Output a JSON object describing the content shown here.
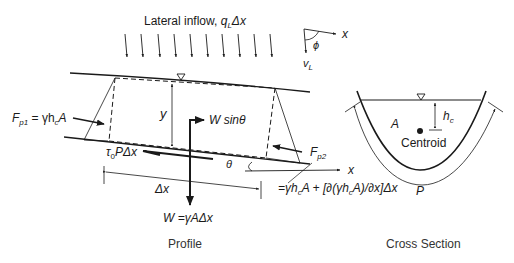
{
  "diagram": {
    "title_lateral_inflow": "Lateral inflow, ",
    "lateral_inflow_symbol": "q",
    "lateral_inflow_sub": "L",
    "lateral_inflow_tail": "Δx",
    "lateral_inflow_arrow_count": 10,
    "angle_axis_x": "x",
    "angle_phi": "ϕ",
    "velocity_v": "v",
    "velocity_sub": "L",
    "profile": {
      "depth_label": "y",
      "fp1_F": "F",
      "fp1_sub": "p1",
      "fp1_eq": " = γh",
      "fp1_c": "c",
      "fp1_A": "A",
      "weight_component": "W sinθ",
      "shear": "τ",
      "shear_sub": "0",
      "shear_tail": "PΔx",
      "theta": "θ",
      "fp2_F": "F",
      "fp2_sub": "p2",
      "fp2_expr_a": "=γh",
      "fp2_expr_c": "c",
      "fp2_expr_b": "A + [∂(γh",
      "fp2_expr_c2": "c",
      "fp2_expr_d": "A)/∂x]Δx",
      "axis_x": "x",
      "dx_label": "Δx",
      "weight": "W =γAΔx",
      "caption": "Profile"
    },
    "cross_section": {
      "area": "A",
      "hc": "h",
      "hc_sub": "c",
      "centroid": "Centroid",
      "perimeter": "P",
      "caption": "Cross Section"
    },
    "colors": {
      "line": "#1a1a1a",
      "text": "#1a1a1a",
      "caption": "#333333"
    }
  }
}
